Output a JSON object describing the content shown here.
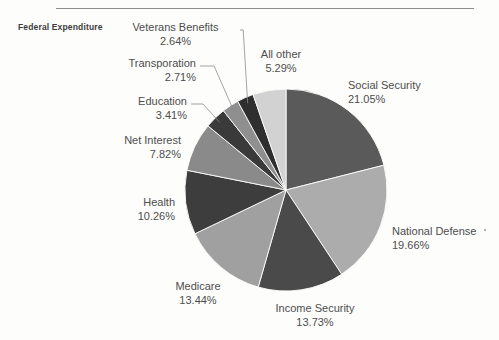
{
  "chart_data": {
    "type": "pie",
    "title": "Federal Expenditure",
    "xlabel": "",
    "ylabel": "",
    "units": "percent",
    "start_angle_deg": -90,
    "direction": "clockwise",
    "categories": [
      "Social Security",
      "National Defense",
      "Income Security",
      "Medicare",
      "Health",
      "Net Interest",
      "Education",
      "Transporation",
      "Veterans Benefits",
      "All other"
    ],
    "values": [
      21.05,
      19.66,
      13.73,
      13.44,
      10.26,
      7.82,
      3.41,
      2.71,
      2.64,
      5.29
    ],
    "value_labels": [
      "21.05%",
      "19.66%",
      "13.73%",
      "13.44%",
      "10.26%",
      "7.82%",
      "3.41%",
      "2.71%",
      "2.64%",
      "5.29%"
    ],
    "colors": [
      "#5a5a5a",
      "#acacac",
      "#4a4a4a",
      "#a0a0a0",
      "#3d3d3d",
      "#8a8a8a",
      "#3a3a3a",
      "#8f8f8f",
      "#2f2f2f",
      "#d2d2d2"
    ],
    "legend": "none",
    "grid": false,
    "leader_lines": true
  },
  "slices": [
    {
      "name": "Social Security",
      "pct": "21.05%",
      "label": "Social Security"
    },
    {
      "name": "National Defense",
      "pct": "19.66%",
      "label": "National Defense"
    },
    {
      "name": "Income Security",
      "pct": "13.73%",
      "label": "Income Security"
    },
    {
      "name": "Medicare",
      "pct": "13.44%",
      "label": "Medicare"
    },
    {
      "name": "Health",
      "pct": "10.26%",
      "label": "Health"
    },
    {
      "name": "Net Interest",
      "pct": "7.82%",
      "label": "Net Interest"
    },
    {
      "name": "Education",
      "pct": "3.41%",
      "label": "Education"
    },
    {
      "name": "Transporation",
      "pct": "2.71%",
      "label": "Transporation"
    },
    {
      "name": "Veterans Benefits",
      "pct": "2.64%",
      "label": "Veterans Benefits"
    },
    {
      "name": "All other",
      "pct": "5.29%",
      "label": "All other"
    }
  ],
  "title": "Federal Expenditure"
}
